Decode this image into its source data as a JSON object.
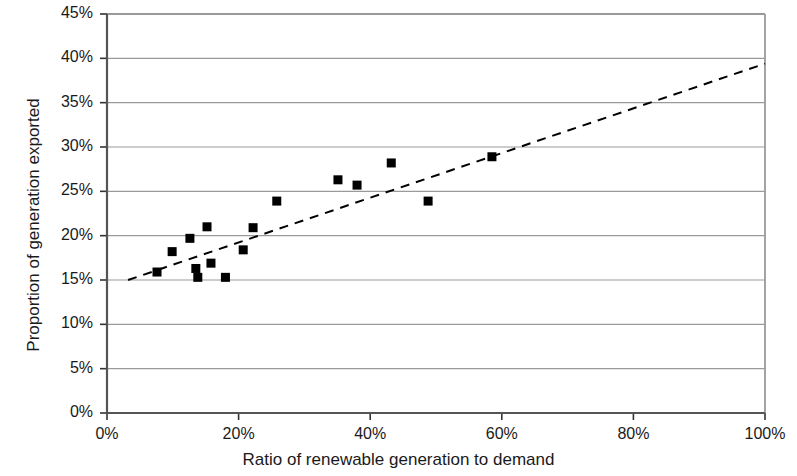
{
  "chart_data": {
    "type": "scatter",
    "title": "",
    "xlabel": "Ratio of renewable generation to demand",
    "ylabel": "Proportion of generation exported",
    "xlim": [
      0,
      100
    ],
    "ylim": [
      0,
      45
    ],
    "x_ticks": [
      "0%",
      "20%",
      "40%",
      "60%",
      "80%",
      "100%"
    ],
    "x_tick_values": [
      0,
      20,
      40,
      60,
      80,
      100
    ],
    "y_ticks": [
      "0%",
      "5%",
      "10%",
      "15%",
      "20%",
      "25%",
      "30%",
      "35%",
      "40%",
      "45%"
    ],
    "y_tick_values": [
      0,
      5,
      10,
      15,
      20,
      25,
      30,
      35,
      40,
      45
    ],
    "grid": true,
    "grid_axis": "y",
    "legend": false,
    "units": "percent",
    "marker": {
      "shape": "square",
      "color": "#000000",
      "size_px": 9
    },
    "series": [
      {
        "name": "Observations",
        "type": "scatter",
        "points": [
          {
            "x": 7.6,
            "y": 15.9
          },
          {
            "x": 9.9,
            "y": 18.2
          },
          {
            "x": 12.6,
            "y": 19.7
          },
          {
            "x": 13.5,
            "y": 16.3
          },
          {
            "x": 13.8,
            "y": 15.3
          },
          {
            "x": 15.2,
            "y": 21.0
          },
          {
            "x": 15.8,
            "y": 16.9
          },
          {
            "x": 18.0,
            "y": 15.3
          },
          {
            "x": 20.7,
            "y": 18.4
          },
          {
            "x": 22.2,
            "y": 20.9
          },
          {
            "x": 25.8,
            "y": 23.9
          },
          {
            "x": 35.1,
            "y": 26.3
          },
          {
            "x": 38.0,
            "y": 25.7
          },
          {
            "x": 43.2,
            "y": 28.2
          },
          {
            "x": 48.8,
            "y": 23.9
          },
          {
            "x": 58.5,
            "y": 28.9
          }
        ]
      },
      {
        "name": "Trend line",
        "type": "line",
        "style": "dashed",
        "color": "#000000",
        "points": [
          {
            "x": 3.2,
            "y": 15.0
          },
          {
            "x": 100.0,
            "y": 39.4
          }
        ]
      }
    ]
  },
  "axes": {
    "x_axis_color": "#555555",
    "y_axis_color": "#555555",
    "gridline_color": "#9a9a9a",
    "plot_background": "#ffffff"
  }
}
